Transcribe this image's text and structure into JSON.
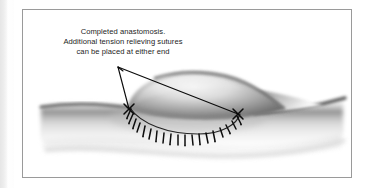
{
  "figure": {
    "caption_lines": [
      "Completed anastomosis.",
      "Additional tension relieving sutures",
      "can be placed at either end"
    ],
    "illustration": {
      "title": "surgical anastomosis illustration",
      "description": "Grayscale airbrush drawing of a tubular structure with a teardrop shaped patch graft sutured along a curved suture line, X marks at both ends",
      "parts": [
        {
          "name": "tube",
          "label": "tubular structure"
        },
        {
          "name": "graft",
          "label": "teardrop patch graft"
        },
        {
          "name": "suture-line",
          "label": "running suture line"
        },
        {
          "name": "x-mark-left",
          "label": "left end tension suture mark"
        },
        {
          "name": "x-mark-right",
          "label": "right end tension suture mark"
        },
        {
          "name": "leader-lines",
          "label": "caption leader lines"
        }
      ],
      "stitch_count": 17
    },
    "colors": {
      "frame_border": "#9a9a9a",
      "caption_text": "#1d1d1d",
      "ink": "#111111",
      "tissue_dark": "#4a4a4a",
      "tissue_mid": "#9b9b9b",
      "tissue_light": "#e8e8e8",
      "page_background": "#ffffff",
      "gutter_shadow": "#e6e6e6"
    },
    "geometry": {
      "frame": {
        "x": 22,
        "y": 9,
        "w": 330,
        "h": 169
      },
      "leader_apex": {
        "x": 95,
        "y": 57
      },
      "x_mark_left": {
        "x": 106,
        "y": 99
      },
      "x_mark_right": {
        "x": 215,
        "y": 104
      }
    }
  }
}
